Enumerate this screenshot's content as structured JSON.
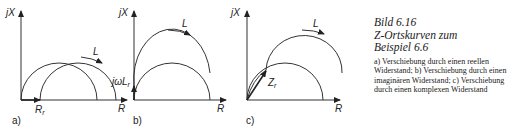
{
  "figure": {
    "panels": [
      {
        "id": "a",
        "panel_label": "a)",
        "y_axis_label": "jX",
        "x_axis_label": "R",
        "shift_label": "R",
        "shift_subscript": "r",
        "direction_label": "L"
      },
      {
        "id": "b",
        "panel_label": "b)",
        "y_axis_label": "jX",
        "x_axis_label": "R",
        "shift_label": "jωL",
        "shift_subscript": "r",
        "direction_label": "L"
      },
      {
        "id": "c",
        "panel_label": "c)",
        "y_axis_label": "jX",
        "x_axis_label": "R",
        "shift_label": "Z",
        "shift_subscript": "r",
        "direction_label": "L"
      }
    ]
  },
  "caption": {
    "line1": "Bild 6.16",
    "line2": "Z-Ortskurven zum",
    "line3": "Beispiel 6.6",
    "body": "a) Verschiebung durch einen reellen Widerstand; b) Verschiebung durch einen imaginären Widerstand; c) Verschiebung durch einen komplexen Widerstand"
  }
}
